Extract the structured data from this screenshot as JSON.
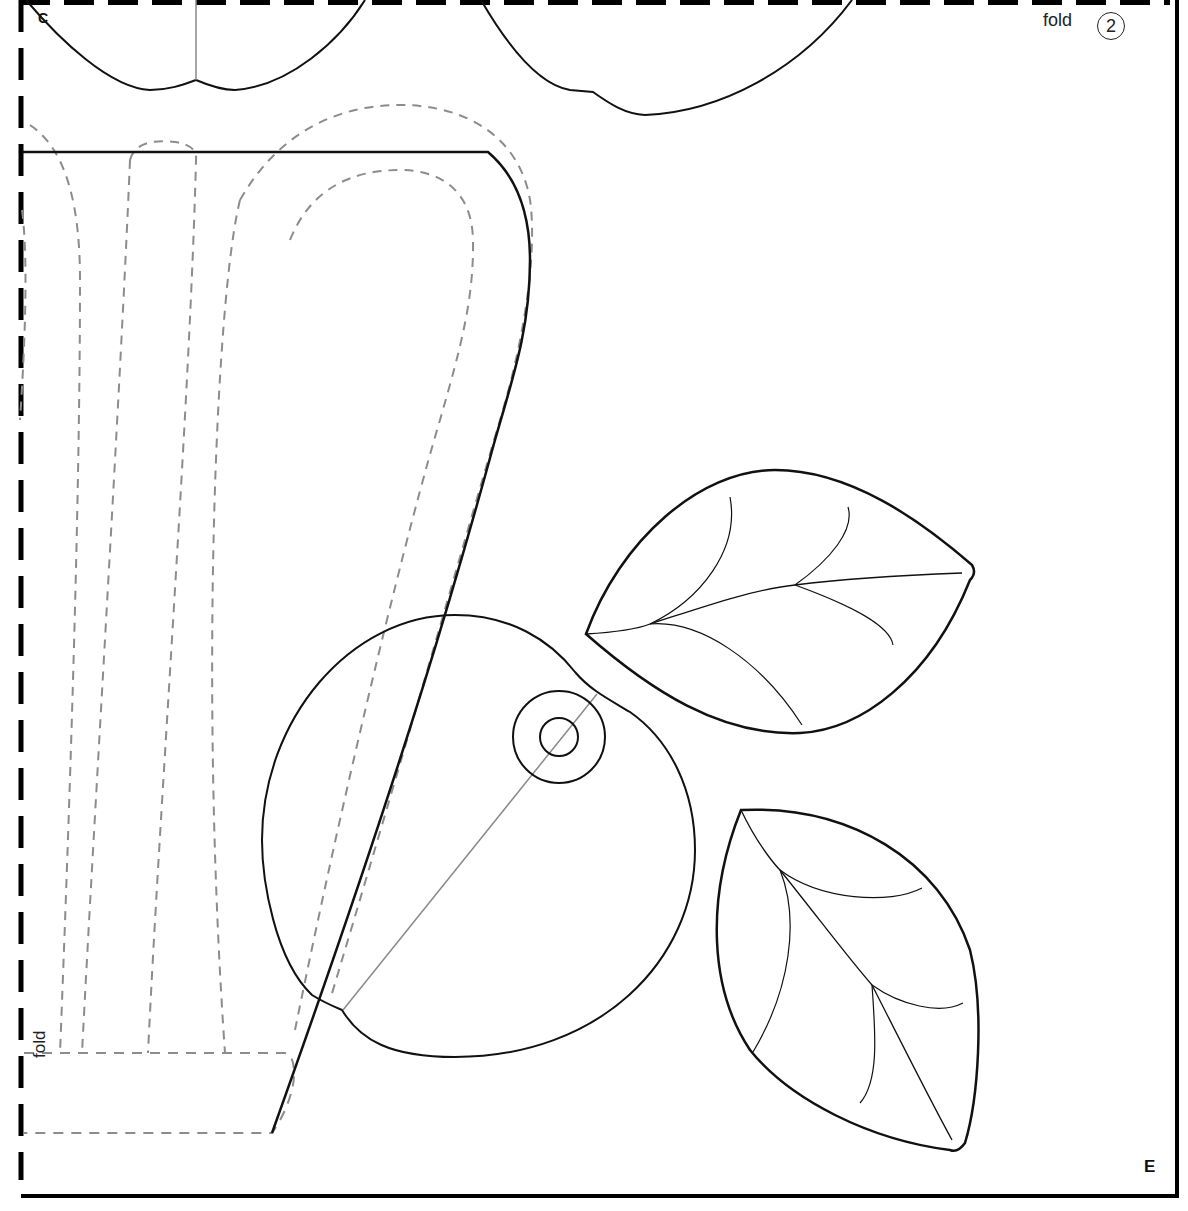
{
  "page": {
    "type": "craft pattern template sheet",
    "background": "#ffffff"
  },
  "labels": {
    "corner_top_left": "C",
    "fold_top": "fold",
    "piece_number": "2",
    "fold_side": "fold",
    "corner_bottom_right": "E"
  },
  "colors": {
    "cut_line": "#111111",
    "stitch_line": "#8c8c8c",
    "guide_line": "#8a8a8a",
    "border": "#000000"
  },
  "pieces": [
    {
      "name": "top-left-petal",
      "line": "solid"
    },
    {
      "name": "top-center-petal",
      "line": "solid"
    },
    {
      "name": "vase-body",
      "line": "solid"
    },
    {
      "name": "vase-stitch-guides",
      "line": "dashed"
    },
    {
      "name": "fold-flap",
      "line": "dashed"
    },
    {
      "name": "round-fruit",
      "line": "solid"
    },
    {
      "name": "fruit-button-marker",
      "line": "solid"
    },
    {
      "name": "upper-leaf",
      "line": "solid"
    },
    {
      "name": "lower-leaf",
      "line": "solid"
    }
  ]
}
